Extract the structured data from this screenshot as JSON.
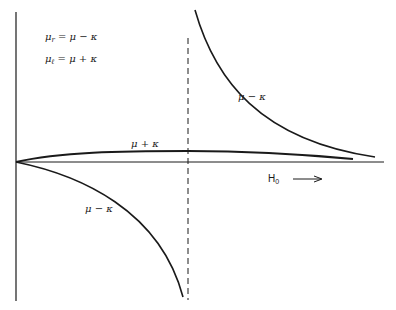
{
  "figure": {
    "legend": {
      "line1": {
        "symbol": "μ",
        "sub": "r",
        "rhs": " = μ − κ"
      },
      "line2": {
        "symbol": "μ",
        "sub": "ℓ",
        "rhs": " = μ + κ"
      }
    },
    "curve_labels": {
      "upper_right": "μ − κ",
      "middle": "μ + κ",
      "lower_left": "μ − κ"
    },
    "x_axis_label": {
      "main": "H",
      "sub": "0"
    },
    "x_axis_arrow": "→",
    "colors": {
      "ink": "#1a1a1a",
      "background": "#ffffff"
    }
  }
}
